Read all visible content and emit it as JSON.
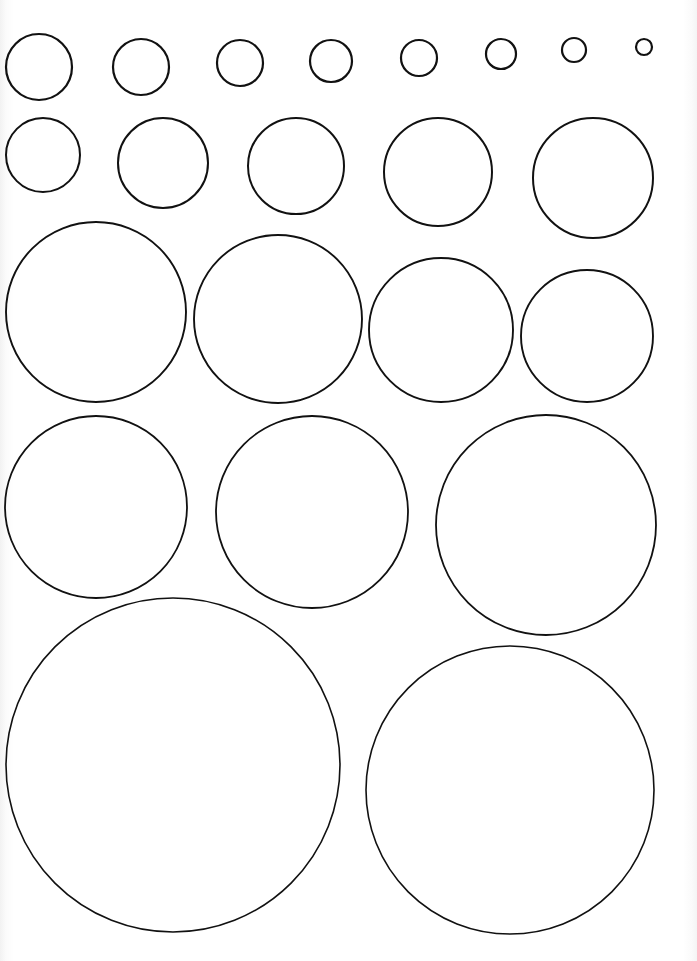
{
  "page": {
    "width": 697,
    "height": 961,
    "background": "#ffffff",
    "stroke_color": "#111111"
  },
  "sheet": {
    "type": "circle-template-worksheet",
    "rows": [
      {
        "label": "row-1",
        "circles": [
          {
            "cx": 39,
            "cy": 67,
            "r": 33,
            "stroke": 2.2
          },
          {
            "cx": 141,
            "cy": 67,
            "r": 28,
            "stroke": 2.2
          },
          {
            "cx": 240,
            "cy": 63,
            "r": 23,
            "stroke": 2.2
          },
          {
            "cx": 331,
            "cy": 61,
            "r": 21,
            "stroke": 2.2
          },
          {
            "cx": 419,
            "cy": 58,
            "r": 18,
            "stroke": 2.2
          },
          {
            "cx": 501,
            "cy": 54,
            "r": 15,
            "stroke": 2.2
          },
          {
            "cx": 574,
            "cy": 50,
            "r": 12,
            "stroke": 2.2
          },
          {
            "cx": 644,
            "cy": 47,
            "r": 8,
            "stroke": 2.2
          }
        ]
      },
      {
        "label": "row-2",
        "circles": [
          {
            "cx": 43,
            "cy": 155,
            "r": 37,
            "stroke": 2.0
          },
          {
            "cx": 163,
            "cy": 163,
            "r": 45,
            "stroke": 2.0
          },
          {
            "cx": 296,
            "cy": 166,
            "r": 48,
            "stroke": 2.0
          },
          {
            "cx": 438,
            "cy": 172,
            "r": 54,
            "stroke": 2.0
          },
          {
            "cx": 593,
            "cy": 178,
            "r": 60,
            "stroke": 2.0
          }
        ]
      },
      {
        "label": "row-3",
        "circles": [
          {
            "cx": 96,
            "cy": 312,
            "r": 90,
            "stroke": 1.9
          },
          {
            "cx": 278,
            "cy": 319,
            "r": 84,
            "stroke": 1.9
          },
          {
            "cx": 441,
            "cy": 330,
            "r": 72,
            "stroke": 1.9
          },
          {
            "cx": 587,
            "cy": 336,
            "r": 66,
            "stroke": 1.9
          }
        ]
      },
      {
        "label": "row-4",
        "circles": [
          {
            "cx": 96,
            "cy": 507,
            "r": 91,
            "stroke": 1.8
          },
          {
            "cx": 312,
            "cy": 512,
            "r": 96,
            "stroke": 1.8
          },
          {
            "cx": 546,
            "cy": 525,
            "r": 110,
            "stroke": 1.8
          }
        ]
      },
      {
        "label": "row-5",
        "circles": [
          {
            "cx": 173,
            "cy": 765,
            "r": 167,
            "stroke": 1.6
          },
          {
            "cx": 510,
            "cy": 790,
            "r": 144,
            "stroke": 1.6
          }
        ]
      }
    ]
  }
}
